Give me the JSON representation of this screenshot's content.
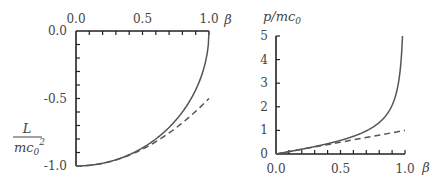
{
  "chart_data": [
    {
      "type": "line",
      "title": "",
      "xlabel": "β",
      "ylabel": "L / mc0²",
      "x_axis_position": "top",
      "xlim": [
        0.0,
        1.0
      ],
      "ylim": [
        -1.0,
        0.0
      ],
      "x_ticks": [
        "0.0",
        "0.5",
        "1.0"
      ],
      "y_ticks": [
        "0.0",
        "-0.5",
        "-1.0"
      ],
      "grid": false,
      "legend": null,
      "series": [
        {
          "name": "relativistic (exact)",
          "style": "solid",
          "x": [
            0.0,
            0.1,
            0.2,
            0.3,
            0.4,
            0.5,
            0.6,
            0.7,
            0.8,
            0.9,
            0.95,
            0.99,
            1.0
          ],
          "values": [
            -1.0,
            -0.995,
            -0.98,
            -0.954,
            -0.917,
            -0.866,
            -0.8,
            -0.714,
            -0.6,
            -0.436,
            -0.312,
            -0.141,
            0.0
          ]
        },
        {
          "name": "non-relativistic approximation",
          "style": "dashed",
          "x": [
            0.0,
            0.1,
            0.2,
            0.3,
            0.4,
            0.5,
            0.6,
            0.7,
            0.8,
            0.9,
            1.0
          ],
          "values": [
            -1.0,
            -0.995,
            -0.98,
            -0.955,
            -0.92,
            -0.875,
            -0.82,
            -0.755,
            -0.68,
            -0.595,
            -0.5
          ]
        }
      ]
    },
    {
      "type": "line",
      "title": "",
      "xlabel": "β",
      "ylabel": "p / mc0",
      "xlim": [
        0.0,
        1.0
      ],
      "ylim": [
        0,
        5
      ],
      "x_ticks": [
        "0.0",
        "0.5",
        "1.0"
      ],
      "y_ticks": [
        "0",
        "1",
        "2",
        "3",
        "4",
        "5"
      ],
      "grid": false,
      "legend": null,
      "series": [
        {
          "name": "relativistic momentum",
          "style": "solid",
          "x": [
            0.0,
            0.1,
            0.2,
            0.3,
            0.4,
            0.5,
            0.6,
            0.7,
            0.8,
            0.9,
            0.95,
            0.98,
            0.98058
          ],
          "values": [
            0.0,
            0.1005,
            0.204,
            0.3145,
            0.4364,
            0.5774,
            0.75,
            0.9802,
            1.3333,
            2.0647,
            3.0424,
            4.9247,
            5.0
          ]
        },
        {
          "name": "classical momentum",
          "style": "dashed",
          "x": [
            0.0,
            1.0
          ],
          "values": [
            0.0,
            1.0
          ]
        }
      ]
    }
  ],
  "left_panel": {
    "x_tick_labels": [
      "0.0",
      "0.5",
      "1.0"
    ],
    "y_tick_labels": [
      "0.0",
      "-0.5",
      "-1.0"
    ],
    "x_axis_label": "β",
    "y_label_num": "L",
    "y_label_den": "mc",
    "y_label_den_sub": "0",
    "y_label_den_sup": "2"
  },
  "right_panel": {
    "x_tick_labels": [
      "0.0",
      "0.5",
      "1.0"
    ],
    "y_tick_labels": [
      "0",
      "1",
      "2",
      "3",
      "4",
      "5"
    ],
    "x_axis_label": "β",
    "y_label": "p/mc",
    "y_label_sub": "0"
  },
  "colors": {
    "curve": "#555555",
    "axis": "#222222",
    "text": "#444444"
  }
}
